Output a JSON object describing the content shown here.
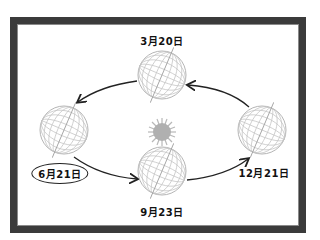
{
  "diagram": {
    "colors": {
      "frame": "#3b3b3b",
      "globe_lines": "#b5b5b5",
      "axis": "#a0a0a0",
      "sun": "#b0b0b0",
      "arrow": "#222222",
      "text": "#111111"
    },
    "center": {
      "name": "sun",
      "icon": "sun-icon"
    },
    "positions": [
      {
        "id": "top",
        "label": "3月20日",
        "highlighted": false
      },
      {
        "id": "left",
        "label": "6月21日",
        "highlighted": true
      },
      {
        "id": "bottom",
        "label": "9月23日",
        "highlighted": false
      },
      {
        "id": "right",
        "label": "12月21日",
        "highlighted": false
      }
    ],
    "arrows": [
      {
        "from": "top",
        "to": "left"
      },
      {
        "from": "left",
        "to": "bottom"
      },
      {
        "from": "bottom",
        "to": "right"
      },
      {
        "from": "right",
        "to": "top"
      }
    ]
  }
}
